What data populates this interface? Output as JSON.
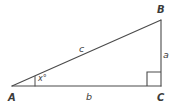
{
  "diagram": {
    "type": "right-triangle",
    "background_color": "#ffffff",
    "stroke_color": "#4a4a4a",
    "label_color": "#3b3b3b",
    "vertices": [
      {
        "id": "A",
        "label": "A",
        "x": 12,
        "y": 86,
        "position": "bottom-left"
      },
      {
        "id": "B",
        "label": "B",
        "x": 161,
        "y": 20,
        "position": "top-right"
      },
      {
        "id": "C",
        "label": "C",
        "x": 161,
        "y": 86,
        "position": "bottom-right"
      }
    ],
    "sides": [
      {
        "id": "a",
        "label": "a",
        "from": "B",
        "to": "C",
        "orientation": "vertical",
        "role": "opposite"
      },
      {
        "id": "b",
        "label": "b",
        "from": "A",
        "to": "C",
        "orientation": "horizontal",
        "role": "adjacent"
      },
      {
        "id": "c",
        "label": "c",
        "from": "A",
        "to": "B",
        "orientation": "diagonal",
        "role": "hypotenuse"
      }
    ],
    "angles": [
      {
        "id": "x",
        "label": "x°",
        "at_vertex": "A",
        "marker": "tick"
      },
      {
        "id": "right",
        "label": "",
        "at_vertex": "C",
        "marker": "right-angle-square",
        "measure": 90
      }
    ]
  }
}
